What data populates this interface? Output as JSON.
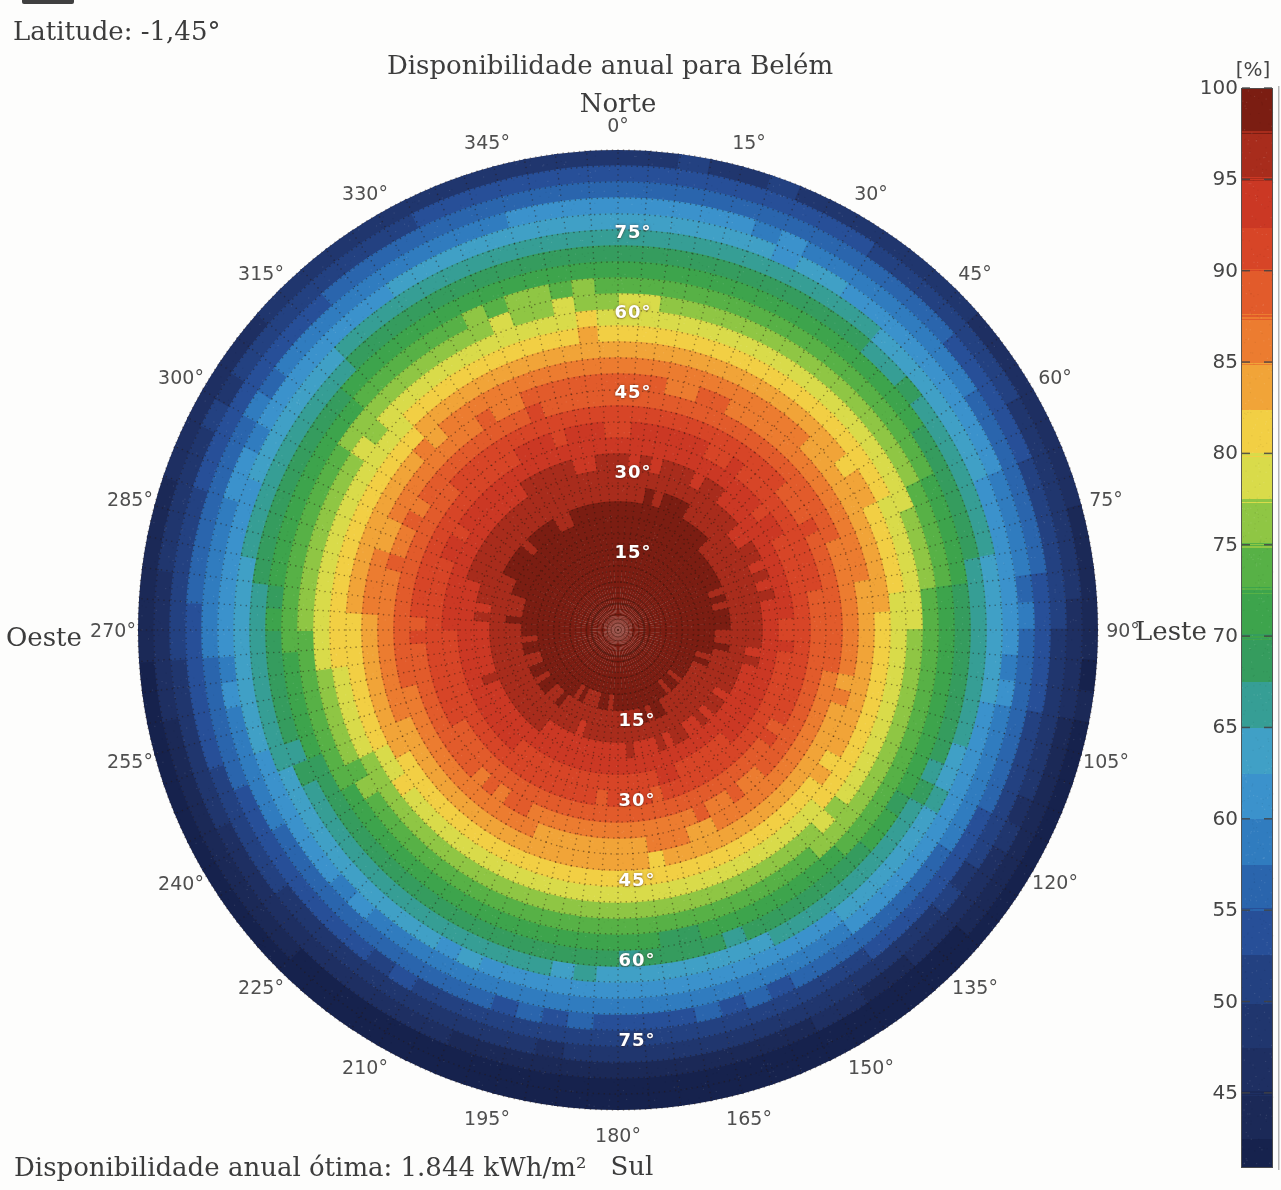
{
  "page": {
    "latitude_label": "Latitude: -1,45°",
    "footer_label": "Disponibilidade anual ótima: 1.844 kWh/m²"
  },
  "chart_data": {
    "type": "heatmap",
    "projection": "polar",
    "title": "Disponibilidade anual para Belém",
    "location": "Belém",
    "latitude_deg": -1.45,
    "optimal_annual_availability_kwh_m2": 1844,
    "value_unit": "%",
    "azimuth_axis": {
      "unit": "deg",
      "direction": "clockwise-from-north",
      "tick_step_deg": 15,
      "tick_labels": [
        "0°",
        "15°",
        "30°",
        "45°",
        "60°",
        "75°",
        "90°",
        "105°",
        "120°",
        "135°",
        "150°",
        "165°",
        "180°",
        "195°",
        "210°",
        "225°",
        "240°",
        "255°",
        "270°",
        "285°",
        "300°",
        "315°",
        "330°",
        "345°"
      ],
      "compass": {
        "north": "Norte",
        "east": "Leste",
        "south": "Sul",
        "west": "Oeste"
      }
    },
    "tilt_axis": {
      "unit": "deg",
      "max": 90,
      "tick_labels": [
        "15°",
        "30°",
        "45°",
        "60°",
        "75°"
      ]
    },
    "colorbar": {
      "title": "[%]",
      "tick_labels": [
        "100",
        "95",
        "90",
        "85",
        "80",
        "75",
        "70",
        "65",
        "60",
        "55",
        "50",
        "45"
      ],
      "value_min": 40.8,
      "value_max": 100,
      "legend_position": "right"
    },
    "availability_percent": {
      "tilt_deg": [
        0,
        15,
        30,
        45,
        60,
        75,
        90
      ],
      "facing_north": [
        100,
        98.5,
        95.8,
        88.8,
        78.5,
        64.8,
        48.0
      ],
      "facing_east_west": [
        100,
        97.4,
        93.4,
        85.3,
        73.8,
        59.0,
        41.0
      ],
      "facing_south": [
        100,
        96.2,
        91.1,
        81.8,
        69.1,
        53.2,
        40.8
      ]
    },
    "model": {
      "base": 100,
      "falloff": 59,
      "exponent": 2,
      "north_bias": 7,
      "quantize_step": 2.5
    },
    "grid": {
      "tilt_step_deg": 3,
      "azimuth_step_deg": 3.75,
      "style": "dotted"
    },
    "colormap_stops": [
      [
        40.8,
        "#15214b"
      ],
      [
        44,
        "#1b2a58"
      ],
      [
        47,
        "#1f3165"
      ],
      [
        50,
        "#213a75"
      ],
      [
        54,
        "#27509a"
      ],
      [
        57,
        "#2b6cb3"
      ],
      [
        60,
        "#3488c8"
      ],
      [
        63,
        "#44a0d2"
      ],
      [
        65,
        "#3aa0b2"
      ],
      [
        67,
        "#339d84"
      ],
      [
        69,
        "#359c58"
      ],
      [
        72,
        "#3fa648"
      ],
      [
        75,
        "#68b845"
      ],
      [
        77,
        "#a6ce43"
      ],
      [
        79,
        "#e0dd4b"
      ],
      [
        81,
        "#f2d445"
      ],
      [
        83,
        "#f2ae3b"
      ],
      [
        85,
        "#ef9232"
      ],
      [
        87,
        "#ea6f2e"
      ],
      [
        90,
        "#dd4c29"
      ],
      [
        93,
        "#cf3a25"
      ],
      [
        95,
        "#c33421"
      ],
      [
        96.4,
        "#a52b1b"
      ],
      [
        98,
        "#831f13"
      ],
      [
        100,
        "#6d190f"
      ]
    ]
  }
}
